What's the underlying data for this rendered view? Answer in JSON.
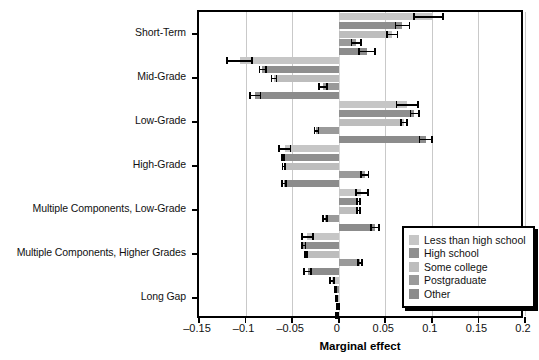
{
  "chart_data": {
    "type": "bar",
    "orientation": "horizontal",
    "title": "",
    "xlabel": "Marginal effect",
    "ylabel": "",
    "xlim": [
      -0.15,
      0.2
    ],
    "xticks": [
      -0.15,
      -0.1,
      -0.05,
      0,
      0.05,
      0.1,
      0.15,
      0.2
    ],
    "xticklabels": [
      "–0.15",
      "–0.1",
      "–0.05",
      "0",
      "0.05",
      "0.1",
      "0.15",
      "0.2"
    ],
    "grid": "vertical",
    "legend_position": "right-bottom-inside",
    "categories": [
      "Short-Term",
      "Mid-Grade",
      "Low-Grade",
      "High-Grade",
      "Multiple Components, Low-Grade",
      "Multiple Components, Higher Grades",
      "Long Gap"
    ],
    "series": [
      {
        "name": "Less than high school",
        "color": "#c6c6c6",
        "values": [
          0.1,
          -0.106,
          0.073,
          -0.058,
          0.024,
          -0.034,
          -0.007
        ],
        "ci_low": [
          0.08,
          -0.121,
          0.061,
          -0.065,
          0.018,
          -0.04,
          -0.01
        ],
        "ci_high": [
          0.113,
          -0.092,
          0.086,
          -0.051,
          0.032,
          -0.027,
          -0.004
        ]
      },
      {
        "name": "High school",
        "color": "#8f8f8f",
        "values": [
          0.068,
          -0.082,
          0.081,
          -0.06,
          0.021,
          -0.038,
          -0.004
        ],
        "ci_low": [
          0.06,
          -0.086,
          0.076,
          -0.062,
          0.019,
          -0.04,
          -0.005
        ],
        "ci_high": [
          0.077,
          -0.077,
          0.087,
          -0.058,
          0.024,
          -0.035,
          -0.002
        ]
      },
      {
        "name": "Some college",
        "color": "#bdbdbd",
        "values": [
          0.057,
          -0.07,
          0.07,
          -0.059,
          0.021,
          -0.035,
          -0.003
        ],
        "ci_low": [
          0.051,
          -0.073,
          0.066,
          -0.061,
          0.019,
          -0.037,
          -0.004
        ],
        "ci_high": [
          0.064,
          -0.066,
          0.074,
          -0.057,
          0.024,
          -0.033,
          -0.001
        ]
      },
      {
        "name": "Postgraduate",
        "color": "#9a9a9a",
        "values": [
          0.019,
          -0.017,
          -0.024,
          0.028,
          -0.015,
          0.023,
          -0.001
        ],
        "ci_low": [
          0.013,
          -0.022,
          -0.027,
          0.023,
          -0.018,
          0.02,
          -0.003
        ],
        "ci_high": [
          0.025,
          -0.012,
          -0.021,
          0.033,
          -0.012,
          0.026,
          0.001
        ]
      },
      {
        "name": "Other",
        "color": "#8c8c8c",
        "values": [
          0.03,
          -0.09,
          0.094,
          -0.059,
          0.039,
          -0.033,
          -0.002
        ],
        "ci_low": [
          0.021,
          -0.096,
          0.086,
          -0.062,
          0.034,
          -0.038,
          -0.004
        ],
        "ci_high": [
          0.04,
          -0.083,
          0.101,
          -0.056,
          0.044,
          -0.029,
          0.0
        ]
      }
    ]
  },
  "legend": {
    "items": [
      {
        "label": "Less than high school",
        "color": "#c6c6c6"
      },
      {
        "label": "High school",
        "color": "#8f8f8f"
      },
      {
        "label": "Some college",
        "color": "#bdbdbd"
      },
      {
        "label": "Postgraduate",
        "color": "#9a9a9a"
      },
      {
        "label": "Other",
        "color": "#8c8c8c"
      }
    ]
  }
}
